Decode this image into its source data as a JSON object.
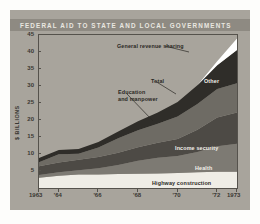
{
  "figure": {
    "title": "FEDERAL AID TO STATE AND LOCAL GOVERNMENTS",
    "background_color": "#a8a49c",
    "title_band_color": "#8e8a82",
    "title_text_color": "#e9e7e0"
  },
  "axes": {
    "ylabel": "$ BILLIONS",
    "yticks": [
      "45",
      "40",
      "35",
      "30",
      "25",
      "20",
      "15",
      "10",
      "5"
    ],
    "ytick_values": [
      45,
      40,
      35,
      30,
      25,
      20,
      15,
      10,
      5
    ],
    "xticks": [
      "1963",
      "'64",
      "'66",
      "'68",
      "'70",
      "'72",
      "1973"
    ],
    "xtick_values": [
      1963,
      1964,
      1966,
      1968,
      1970,
      1972,
      1973
    ]
  },
  "annotations": {
    "general_revenue_sharing": "General revenue sharing",
    "total": "Total",
    "other": "Other",
    "education_and_manpower": "Education\nand manpower",
    "education_line1": "Education",
    "education_line2": "and manpower",
    "income_security": "Income security",
    "health": "Health",
    "highway_construction": "Highway construction"
  },
  "chart_data": {
    "type": "area",
    "title": "FEDERAL AID TO STATE AND LOCAL GOVERNMENTS",
    "subtitle": "",
    "xlabel": "",
    "ylabel": "$ BILLIONS",
    "xlim": [
      1963,
      1973
    ],
    "ylim": [
      0,
      45
    ],
    "grid": false,
    "legend": "inline-annotations",
    "stacked": true,
    "x": [
      1963,
      1964,
      1965,
      1966,
      1967,
      1968,
      1969,
      1970,
      1971,
      1972,
      1973
    ],
    "series": [
      {
        "name": "Highway construction",
        "color": "#efede6",
        "values": [
          3.0,
          3.6,
          4.0,
          4.0,
          4.1,
          4.2,
          4.3,
          4.4,
          4.6,
          4.8,
          4.8
        ]
      },
      {
        "name": "Health",
        "color": "#7d7a73",
        "values": [
          0.8,
          1.0,
          1.2,
          1.8,
          2.7,
          3.8,
          4.6,
          5.0,
          6.0,
          7.5,
          8.2
        ]
      },
      {
        "name": "Income security",
        "color": "#4d4a45",
        "values": [
          2.6,
          2.9,
          3.1,
          3.3,
          3.6,
          4.0,
          4.4,
          5.0,
          6.5,
          8.4,
          9.2
        ]
      },
      {
        "name": "Education and manpower",
        "color": "#6e6b64",
        "values": [
          1.2,
          2.4,
          1.8,
          2.8,
          4.2,
          5.0,
          5.6,
          6.6,
          7.6,
          8.4,
          8.6
        ]
      },
      {
        "name": "Other",
        "color": "#2f2d29",
        "values": [
          1.2,
          1.3,
          1.4,
          1.6,
          2.0,
          2.6,
          3.3,
          4.3,
          5.5,
          7.0,
          9.8
        ]
      },
      {
        "name": "General revenue sharing",
        "color": "#ffffff",
        "values": [
          0,
          0,
          0,
          0,
          0,
          0,
          0,
          0,
          0,
          1.2,
          3.4
        ]
      }
    ],
    "total_label": "Total",
    "totals": [
      8.8,
      11.2,
      11.5,
      13.5,
      16.6,
      19.6,
      22.2,
      25.3,
      30.2,
      37.3,
      44.0
    ]
  }
}
